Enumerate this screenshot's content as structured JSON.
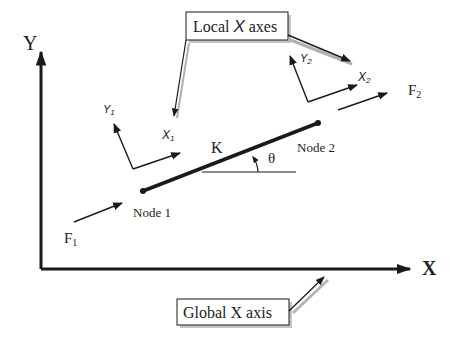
{
  "diagram": {
    "global_axes": {
      "y_label": "Y",
      "x_label": "X"
    },
    "callouts": {
      "local_axes": {
        "prefix": "Local ",
        "axis": "X",
        "suffix": " axes"
      },
      "global_axis": "Global X axis"
    },
    "element": {
      "stiffness_label": "K",
      "angle_label": "θ",
      "node1_label": "Node 1",
      "node2_label": "Node 2"
    },
    "local_frames": {
      "node1": {
        "y": "Y",
        "y_sub": "1",
        "x": "X",
        "x_sub": "1"
      },
      "node2": {
        "y": "Y",
        "y_sub": "2",
        "x": "X",
        "x_sub": "2"
      }
    },
    "forces": {
      "f1": {
        "label": "F",
        "sub": "1"
      },
      "f2": {
        "label": "F",
        "sub": "2"
      }
    },
    "colors": {
      "line": "#1a1a1a",
      "shadow": "#b0b0b0",
      "background": "#ffffff"
    }
  }
}
